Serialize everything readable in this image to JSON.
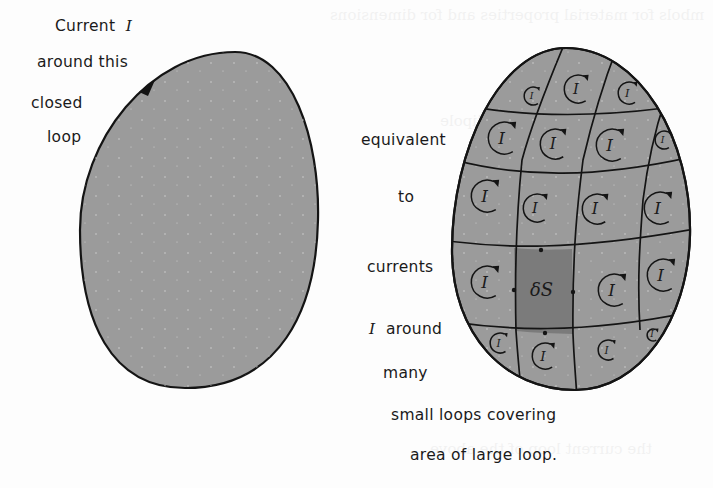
{
  "figure": {
    "left_caption": {
      "line1_text": "Current",
      "line1_symbol": "I",
      "line2": "around this",
      "line3": "closed",
      "line4": "loop"
    },
    "middle_caption": {
      "line1": "equivalent",
      "line2": "to",
      "line3": "currents",
      "line4_symbol": "I",
      "line4_text": "around",
      "line5": "many",
      "line6": "small loops covering",
      "line7": "area of large loop."
    },
    "cell_symbol": "I",
    "element_label": "δS",
    "colors": {
      "loop_fill": "#9b9b9b",
      "element_fill": "#7b7b7b",
      "outline": "#141414",
      "text": "#1a1a1a"
    }
  }
}
